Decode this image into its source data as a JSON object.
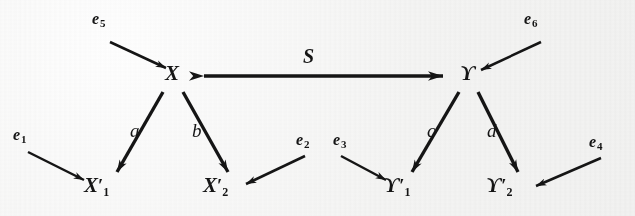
{
  "figure": {
    "background_color": "#f7f7f6",
    "ink_color": "#151515"
  },
  "nodes": [
    {
      "id": "X",
      "label": "X",
      "prime": "",
      "subscript": "",
      "x": 172,
      "y": 76
    },
    {
      "id": "Y",
      "label": "ϒ",
      "prime": "",
      "subscript": "",
      "x": 468,
      "y": 76
    },
    {
      "id": "X1p",
      "label": "X",
      "prime": "′",
      "subscript": "1",
      "x": 97,
      "y": 188
    },
    {
      "id": "X2p",
      "label": "X",
      "prime": "′",
      "subscript": "2",
      "x": 216,
      "y": 188
    },
    {
      "id": "Y1p",
      "label": "ϒ",
      "prime": "′",
      "subscript": "1",
      "x": 396,
      "y": 188
    },
    {
      "id": "Y2p",
      "label": "ϒ",
      "prime": "′",
      "subscript": "2",
      "x": 498,
      "y": 188
    }
  ],
  "edges": [
    {
      "id": "S",
      "label": "S",
      "from": "X",
      "to": "Y",
      "arrow": "double",
      "label_x": 307,
      "label_y": 55
    },
    {
      "id": "a",
      "label": "a",
      "from": "X",
      "to": "X1p",
      "arrow": "single",
      "label_x": 134,
      "label_y": 130
    },
    {
      "id": "b",
      "label": "b",
      "from": "X",
      "to": "X2p",
      "arrow": "single",
      "label_x": 196,
      "label_y": 130
    },
    {
      "id": "c",
      "label": "c",
      "from": "Y",
      "to": "Y1p",
      "arrow": "single",
      "label_x": 431,
      "label_y": 130
    },
    {
      "id": "d",
      "label": "d",
      "from": "Y",
      "to": "Y2p",
      "arrow": "single",
      "label_x": 491,
      "label_y": 130
    }
  ],
  "external_edges": [
    {
      "id": "e1",
      "label": "e",
      "subscript": "1",
      "target": "X1p",
      "label_x": 15,
      "label_y": 133
    },
    {
      "id": "e2",
      "label": "e",
      "subscript": "2",
      "target": "X2p",
      "label_x": 300,
      "label_y": 138
    },
    {
      "id": "e3",
      "label": "e",
      "subscript": "3",
      "target": "Y1p",
      "label_x": 336,
      "label_y": 138
    },
    {
      "id": "e4",
      "label": "e",
      "subscript": "4",
      "target": "Y2p",
      "label_x": 592,
      "label_y": 140
    },
    {
      "id": "e5",
      "label": "e",
      "subscript": "5",
      "target": "X",
      "label_x": 95,
      "label_y": 17
    },
    {
      "id": "e6",
      "label": "e",
      "subscript": "6",
      "target": "Y",
      "label_x": 527,
      "label_y": 17
    }
  ]
}
